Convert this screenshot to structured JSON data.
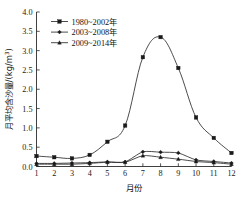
{
  "chart_data": {
    "type": "line",
    "title": "",
    "xlabel": "月份",
    "ylabel": "月平均含沙量/(kg/m³)",
    "ylabel_main": "月平均含沙量/(kg/m",
    "ylabel_sup": "3",
    "ylabel_tail": ")",
    "categories": [
      "1",
      "2",
      "3",
      "4",
      "5",
      "6",
      "7",
      "8",
      "9",
      "10",
      "11",
      "12"
    ],
    "x": [
      1,
      2,
      3,
      4,
      5,
      6,
      7,
      8,
      9,
      10,
      11,
      12
    ],
    "xlim": [
      1,
      12
    ],
    "ylim": [
      0.0,
      4.0
    ],
    "ytick_labels": [
      "0.0",
      "0.5",
      "1.0",
      "1.5",
      "2.0",
      "2.5",
      "3.0",
      "3.5",
      "4.0"
    ],
    "ytick_values": [
      0.0,
      0.5,
      1.0,
      1.5,
      2.0,
      2.5,
      3.0,
      3.5,
      4.0
    ],
    "grid": false,
    "legend_position": "top-left",
    "series": [
      {
        "name": "1980~2002年",
        "marker": "square",
        "values": [
          0.27,
          0.24,
          0.21,
          0.3,
          0.64,
          1.06,
          2.83,
          3.35,
          2.55,
          1.27,
          0.74,
          0.35
        ]
      },
      {
        "name": "2003~2008年",
        "marker": "diamond",
        "values": [
          0.08,
          0.08,
          0.09,
          0.1,
          0.12,
          0.12,
          0.38,
          0.37,
          0.35,
          0.17,
          0.13,
          0.09
        ]
      },
      {
        "name": "2009~2014年",
        "marker": "triangle",
        "values": [
          0.06,
          0.06,
          0.06,
          0.08,
          0.11,
          0.11,
          0.28,
          0.24,
          0.19,
          0.13,
          0.1,
          0.06
        ]
      }
    ]
  },
  "colors": {
    "axis": "#2a2a2a",
    "line": "#2c2c2c",
    "marker": "#1a1a1a",
    "background": "#ffffff"
  }
}
